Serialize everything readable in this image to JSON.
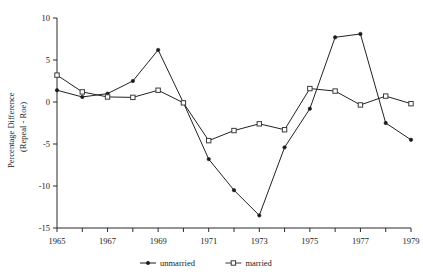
{
  "chart_data": {
    "type": "line",
    "title": "",
    "subtitle": "",
    "xlabel": "",
    "ylabel": "Percentage Difference (Repeal - Roe)",
    "ylabel_line1": "Percentage Difference",
    "ylabel_line2": "(Repeal - Roe)",
    "x": [
      1965,
      1966,
      1967,
      1968,
      1969,
      1970,
      1971,
      1972,
      1973,
      1974,
      1975,
      1976,
      1977,
      1978,
      1979
    ],
    "categories": [
      "1965",
      "1966",
      "1967",
      "1968",
      "1969",
      "1970",
      "1971",
      "1972",
      "1973",
      "1974",
      "1975",
      "1976",
      "1977",
      "1978",
      "1979"
    ],
    "xtick_labels": [
      "1965",
      "1967",
      "1969",
      "1971",
      "1973",
      "1975",
      "1977",
      "1979"
    ],
    "xtick_values": [
      1965,
      1967,
      1969,
      1971,
      1973,
      1975,
      1977,
      1979
    ],
    "ytick_labels": [
      "10",
      "5",
      "0",
      "-5",
      "-10",
      "-15"
    ],
    "ytick_values": [
      10,
      5,
      0,
      -5,
      -10,
      -15
    ],
    "xlim": [
      1965,
      1979
    ],
    "ylim": [
      -15,
      10
    ],
    "grid": false,
    "legend_position": "bottom",
    "series": [
      {
        "name": "unmarried",
        "marker": "filled-circle",
        "color": "#1a1a1a",
        "values": [
          1.4,
          0.6,
          1.0,
          2.5,
          6.2,
          -0.1,
          -6.8,
          -10.5,
          -13.5,
          -5.4,
          -0.8,
          7.7,
          8.1,
          -2.5,
          -4.5
        ]
      },
      {
        "name": "married",
        "marker": "open-square",
        "color": "#3b3b3b",
        "values": [
          3.2,
          1.2,
          0.6,
          0.55,
          1.4,
          -0.1,
          -4.6,
          -3.4,
          -2.6,
          -3.3,
          1.6,
          1.3,
          -0.35,
          0.7,
          -0.2
        ]
      }
    ]
  },
  "legend": {
    "items": [
      {
        "label": "unmarried",
        "marker": "filled-circle"
      },
      {
        "label": "married",
        "marker": "open-square"
      }
    ]
  }
}
